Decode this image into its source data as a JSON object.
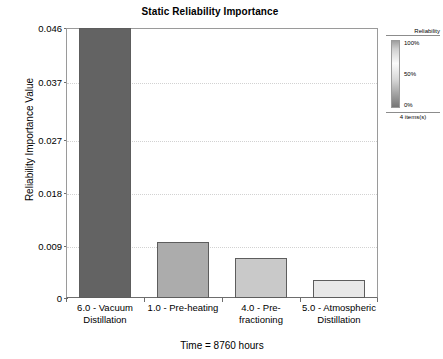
{
  "chart_data": {
    "type": "bar",
    "title": "Static Reliability Importance",
    "subtitle": "Time = 8760 hours",
    "xlabel": "",
    "ylabel": "Reliability Importance Value",
    "categories": [
      "6.0 - Vacuum Distillation",
      "1.0 - Pre-heating",
      "4.0 - Pre-fractioning",
      "5.0 - Atmospheric Distillation"
    ],
    "values": [
      0.046,
      0.0096,
      0.0068,
      0.0031
    ],
    "ylim": [
      0,
      0.046
    ],
    "yticks": [
      0,
      0.009,
      0.018,
      0.027,
      0.037,
      0.046
    ],
    "ytick_labels": [
      "0",
      "0.009",
      "0.018",
      "0.027",
      "0.037",
      "0.046"
    ],
    "grid": true,
    "legend_position": "right",
    "bar_colors": [
      "#636363",
      "#acacac",
      "#c9c9c9",
      "#e8e8e8"
    ]
  },
  "title": "Static Reliability Importance",
  "footer": "Time = 8760 hours",
  "axes": {
    "y_title": "Reliability Importance Value",
    "y_ticks": [
      {
        "label": "0.046",
        "value": 0.046
      },
      {
        "label": "0.037",
        "value": 0.037
      },
      {
        "label": "0.027",
        "value": 0.027
      },
      {
        "label": "0.018",
        "value": 0.018
      },
      {
        "label": "0.009",
        "value": 0.009
      },
      {
        "label": "0",
        "value": 0
      }
    ],
    "x_labels": [
      "6.0 - Vacuum Distillation",
      "1.0 - Pre-heating",
      "4.0 - Pre-fractioning",
      "5.0 - Atmospheric Distillation"
    ]
  },
  "bars": [
    {
      "label": "6.0 - Vacuum Distillation",
      "value": 0.046,
      "color": "#636363"
    },
    {
      "label": "1.0 - Pre-heating",
      "value": 0.0096,
      "color": "#acacac"
    },
    {
      "label": "4.0 - Pre-fractioning",
      "value": 0.0068,
      "color": "#c9c9c9"
    },
    {
      "label": "5.0 - Atmospheric Distillation",
      "value": 0.0031,
      "color": "#e8e8e8"
    }
  ],
  "legend": {
    "title": "Reliability",
    "max_label": "100%",
    "mid_label": "50%",
    "min_label": "0%",
    "count_label": "4 items(s)"
  }
}
